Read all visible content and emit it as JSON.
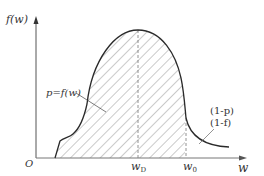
{
  "diagram": {
    "type": "distribution-curve",
    "axes": {
      "y_label": "f(w)",
      "x_label": "w",
      "origin_label": "O"
    },
    "ticks": {
      "w_D": {
        "main": "w",
        "sub": "D"
      },
      "w_0": {
        "main": "w",
        "sub": "0"
      }
    },
    "annotations": {
      "curve_label": "p=f(w)",
      "tail_label_line1": "(1-p)",
      "tail_label_line2": "(1-f)"
    },
    "colors": {
      "curve": "#2a2a2a",
      "axis": "#555555",
      "hatch": "#777777",
      "dashed": "#777777"
    }
  }
}
